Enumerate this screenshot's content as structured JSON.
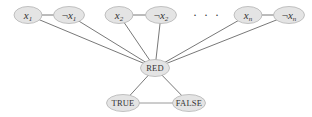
{
  "diagram": {
    "type": "graph",
    "nodes": [
      {
        "id": "x1",
        "label": "x",
        "sub": "1",
        "negated": false,
        "cx": 28,
        "cy": 15
      },
      {
        "id": "nx1",
        "label": "x",
        "sub": "1",
        "negated": true,
        "cx": 69,
        "cy": 15
      },
      {
        "id": "x2",
        "label": "x",
        "sub": "2",
        "negated": false,
        "cx": 119,
        "cy": 15
      },
      {
        "id": "nx2",
        "label": "x",
        "sub": "2",
        "negated": true,
        "cx": 161,
        "cy": 15
      },
      {
        "id": "xn",
        "label": "x",
        "sub": "n",
        "negated": false,
        "cx": 248,
        "cy": 15
      },
      {
        "id": "nxn",
        "label": "x",
        "sub": "n",
        "negated": true,
        "cx": 289,
        "cy": 15
      },
      {
        "id": "red",
        "label": "RED",
        "cx": 155,
        "cy": 68
      },
      {
        "id": "true",
        "label": "TRUE",
        "cx": 123,
        "cy": 103
      },
      {
        "id": "false",
        "label": "FALSE",
        "cx": 189,
        "cy": 103
      }
    ],
    "ellipsis": "· · ·",
    "negation_symbol": "¬",
    "edges": [
      [
        "x1",
        "nx1"
      ],
      [
        "x2",
        "nx2"
      ],
      [
        "xn",
        "nxn"
      ],
      [
        "x1",
        "red"
      ],
      [
        "nx1",
        "red"
      ],
      [
        "x2",
        "red"
      ],
      [
        "nx2",
        "red"
      ],
      [
        "xn",
        "red"
      ],
      [
        "nxn",
        "red"
      ],
      [
        "red",
        "true"
      ],
      [
        "red",
        "false"
      ],
      [
        "true",
        "false"
      ]
    ],
    "colors": {
      "node_fill": "#e4e4e4",
      "node_stroke": "#b4b4b4",
      "edge": "#555555",
      "text": "#333333"
    }
  }
}
